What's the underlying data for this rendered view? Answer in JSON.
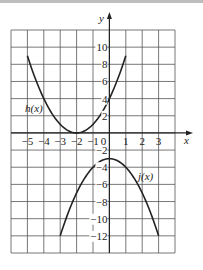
{
  "chart_data": {
    "type": "line",
    "title": "",
    "xlabel": "x",
    "ylabel": "y",
    "xlim": [
      -6,
      4
    ],
    "ylim": [
      -14,
      12
    ],
    "grid": true,
    "x_ticks": [
      -5,
      -4,
      -3,
      -2,
      -1,
      0,
      1,
      2,
      3
    ],
    "x_tick_labels": [
      "−5",
      "−4",
      "−3",
      "−2",
      "−1",
      "0",
      "1",
      "2",
      "3"
    ],
    "y_ticks": [
      10,
      8,
      6,
      4,
      2,
      -2,
      -4,
      -6,
      -8,
      -10,
      -12
    ],
    "y_tick_labels": [
      "10",
      "8",
      "6",
      "4",
      "2",
      "−2",
      "−4",
      "−6",
      "−8",
      "−10",
      "−12"
    ],
    "series": [
      {
        "name": "h(x)",
        "label": "h(x)",
        "formula": "(x+2)^2",
        "x": [
          -5,
          -4,
          -3,
          -2,
          -1,
          0,
          1
        ],
        "y": [
          9,
          4,
          1,
          0,
          1,
          4,
          9
        ]
      },
      {
        "name": "j(x)",
        "label": "j(x)",
        "formula": "-x^2-3",
        "x": [
          -3,
          -2,
          -1,
          0,
          1,
          2,
          3
        ],
        "y": [
          -12,
          -7,
          -4,
          -3,
          -4,
          -7,
          -12
        ]
      }
    ]
  },
  "labels": {
    "x_axis": "x",
    "y_axis": "y",
    "h_label": "h(x)",
    "j_label": "j(x)"
  }
}
